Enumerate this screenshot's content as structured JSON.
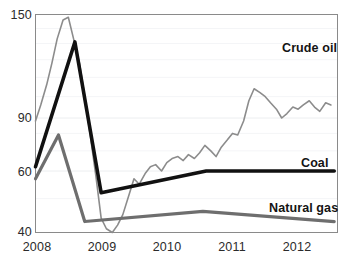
{
  "chart_data": {
    "type": "line",
    "title": "",
    "subtitle": "",
    "xlabel": "",
    "ylabel": "",
    "grid": true,
    "grid_orientation": "horizontal",
    "legend_position": "inline-right",
    "xlim": [
      2008.0,
      2012.6
    ],
    "ylim": [
      38,
      155
    ],
    "yscale": "log-like",
    "y_ticks": [
      40,
      60,
      90,
      150
    ],
    "y_tick_labels": [
      "40",
      "60",
      "90",
      "150"
    ],
    "x_ticks": [
      2008,
      2009,
      2010,
      2011,
      2012
    ],
    "x_tick_labels": [
      "2008",
      "2009",
      "2010",
      "2011",
      "2012"
    ],
    "series": [
      {
        "name": "Crude oil",
        "label": "Crude oil",
        "color": "#8c8c8c",
        "width": 1.6,
        "style": "jagged-monthly",
        "label_x": 2011.75,
        "label_y": 127,
        "x": [
          2008.0,
          2008.08,
          2008.17,
          2008.25,
          2008.33,
          2008.42,
          2008.5,
          2008.58,
          2008.67,
          2008.75,
          2008.83,
          2008.92,
          2009.0,
          2009.08,
          2009.17,
          2009.25,
          2009.33,
          2009.42,
          2009.5,
          2009.58,
          2009.67,
          2009.75,
          2009.83,
          2009.92,
          2010.0,
          2010.08,
          2010.17,
          2010.25,
          2010.33,
          2010.42,
          2010.5,
          2010.58,
          2010.67,
          2010.75,
          2010.83,
          2010.92,
          2011.0,
          2011.08,
          2011.17,
          2011.25,
          2011.33,
          2011.42,
          2011.5,
          2011.58,
          2011.67,
          2011.75,
          2011.83,
          2011.92,
          2012.0,
          2012.08,
          2012.17,
          2012.25,
          2012.33,
          2012.42,
          2012.5
        ],
        "values": [
          88,
          96,
          106,
          118,
          133,
          146,
          148,
          133,
          118,
          100,
          80,
          58,
          44,
          41,
          40,
          42,
          45,
          51,
          57,
          55,
          59,
          62,
          63,
          60,
          64,
          66,
          67,
          65,
          68,
          66,
          69,
          73,
          70,
          67,
          72,
          76,
          80,
          79,
          88,
          98,
          104,
          102,
          100,
          97,
          94,
          90,
          92,
          95,
          94,
          96,
          98,
          95,
          93,
          97,
          96
        ],
        "peak_value": 148,
        "peak_x": 2008.5,
        "trough_value": 40,
        "trough_x": 2009.17,
        "end_value": 96
      },
      {
        "name": "Coal",
        "label": "Coal",
        "color": "#111111",
        "width": 3.6,
        "style": "piecewise-linear",
        "label_x": 2012.05,
        "label_y": 64,
        "x": [
          2008.0,
          2008.6,
          2009.0,
          2010.6,
          2012.55
        ],
        "values": [
          62,
          131,
          52,
          60,
          60
        ],
        "peak_value": 131,
        "peak_x": 2008.6,
        "trough_value": 52,
        "trough_x": 2009.0,
        "end_value": 60
      },
      {
        "name": "Natural gas",
        "label": "Natural gas",
        "color": "#6e6e6e",
        "width": 3.2,
        "style": "piecewise-linear",
        "label_x": 2011.55,
        "label_y": 47,
        "x": [
          2008.0,
          2008.35,
          2008.75,
          2010.55,
          2012.55
        ],
        "values": [
          57,
          79,
          43,
          46,
          43
        ],
        "peak_value": 79,
        "peak_x": 2008.35,
        "trough_value": 43,
        "trough_x": 2008.75,
        "end_value": 43
      }
    ]
  },
  "axes": {
    "frame_color": "#8a8a8a",
    "gridline_color": "#eceef0",
    "background": "#ffffff",
    "tick_text_color": "#2b2b2b"
  }
}
